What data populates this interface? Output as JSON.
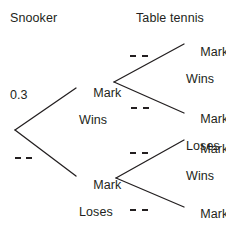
{
  "diagram": {
    "type": "probability-tree",
    "title": "",
    "headers": [
      {
        "id": "stage-1",
        "label": "Snooker"
      },
      {
        "id": "stage-2",
        "label": "Table tennis"
      }
    ],
    "nodes": {
      "root": {
        "label": ""
      },
      "snooker_win": {
        "line1": "Mark",
        "line2": "Wins"
      },
      "snooker_lose": {
        "line1": "Mark",
        "line2": "Loses"
      },
      "tt_win_win": {
        "line1": "Mark",
        "line2": "Wins"
      },
      "tt_win_lose": {
        "line1": "Mark",
        "line2": "Loses"
      },
      "tt_lose_win": {
        "line1": "Mark",
        "line2": "Wins"
      },
      "tt_lose_lose": {
        "line1": "Mark",
        "line2": "Loses"
      }
    },
    "branch_labels": {
      "snooker_win": "0.3",
      "snooker_lose": "",
      "tt_win_win": "",
      "tt_win_lose": "",
      "tt_lose_win": "",
      "tt_lose_lose": ""
    },
    "blank_marker": "----",
    "colors": {
      "ink": "#231f20",
      "background": "#ffffff"
    }
  }
}
